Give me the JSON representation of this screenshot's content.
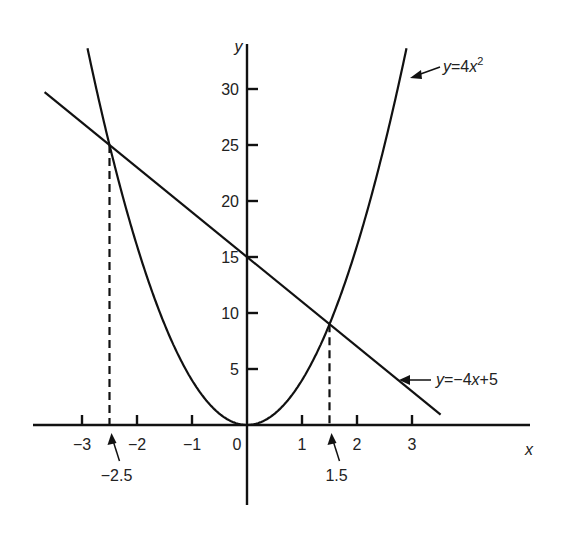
{
  "chart_data": {
    "type": "line",
    "title": "",
    "xlabel": "x",
    "ylabel": "y",
    "xlim": [
      -3.8,
      5.1
    ],
    "ylim": [
      -8,
      34
    ],
    "grid": false,
    "x_ticks": [
      -3,
      -2,
      -1,
      0,
      1,
      2,
      3
    ],
    "x_tick_labels": [
      "−3",
      "−2",
      "−1",
      "0",
      "1",
      "2",
      "3"
    ],
    "y_ticks": [
      5,
      10,
      15,
      20,
      25,
      30
    ],
    "y_tick_labels": [
      "5",
      "10",
      "15",
      "20",
      "25",
      "30"
    ],
    "series": [
      {
        "name": "y=4x²",
        "label_main": "y=4x",
        "label_sup": "2",
        "kind": "parabola",
        "a": 4,
        "x_range": [
          -2.9,
          2.9
        ]
      },
      {
        "name": "y=−4x+5",
        "label": "y=−4x+5",
        "kind": "line",
        "slope": -4,
        "intercept": 15,
        "x_range": [
          -3.68,
          3.52
        ]
      }
    ],
    "intersections": [
      {
        "x": -2.5,
        "y": 25,
        "label": "−2.5"
      },
      {
        "x": 1.5,
        "y": 9,
        "label": "1.5"
      }
    ],
    "annotations": [
      {
        "text": "y=4x²",
        "arrow_to_series": 0
      },
      {
        "text": "y=−4x+5",
        "arrow_to_series": 1
      },
      {
        "text": "−2.5",
        "arrow_to_x": -2.5
      },
      {
        "text": "1.5",
        "arrow_to_x": 1.5
      }
    ]
  }
}
